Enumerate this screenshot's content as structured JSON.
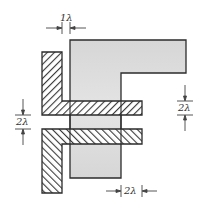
{
  "diagram": {
    "type": "layout-design-rule",
    "colors": {
      "background": "#ffffff",
      "diffusion_fill": "#d9d9d9",
      "outline": "#2b2b2b",
      "hatch": "#3a3a3a",
      "hatch_bg": "#ffffff",
      "dimension_line": "#444444"
    },
    "shapes": [
      {
        "name": "gray-F-region",
        "fill": "solid-gray"
      },
      {
        "name": "upper-hatched-L",
        "hatch": "backslash"
      },
      {
        "name": "lower-hatched-L",
        "hatch": "slash"
      }
    ],
    "dimensions": {
      "top": {
        "label": "1λ",
        "description": "gap between upper hatched leg and gray region"
      },
      "left": {
        "label": "2λ",
        "description": "spacing between the two hatched bars"
      },
      "right": {
        "label": "2λ",
        "description": "vertical extent marker on right"
      },
      "bottom": {
        "label": "2λ",
        "description": "bar extension beyond gray region"
      }
    }
  }
}
